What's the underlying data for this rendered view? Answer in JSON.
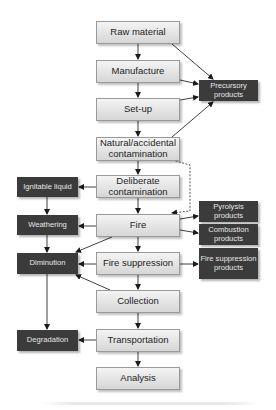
{
  "diagram": {
    "nodes": {
      "raw_material": "Raw material",
      "manufacture": "Manufacture",
      "set_up": "Set-up",
      "natural_contamination": "Natural/accidental contamination",
      "deliberate_contamination": "Deliberate contamination",
      "fire": "Fire",
      "fire_suppression": "Fire suppression",
      "collection": "Collection",
      "transportation": "Transportation",
      "analysis": "Analysis",
      "precursory_products": "Precursory products",
      "ignitable_liquid": "Ignitable liquid",
      "weathering": "Weathering",
      "diminution": "Diminution",
      "degradation": "Degradation",
      "pyrolysis_products": "Pyrolysis products",
      "combustion_products": "Combustion products",
      "fire_suppression_products": "Fire suppression products"
    },
    "edges": [
      {
        "from": "raw_material",
        "to": "manufacture",
        "style": "solid"
      },
      {
        "from": "manufacture",
        "to": "set_up",
        "style": "solid"
      },
      {
        "from": "set_up",
        "to": "natural_contamination",
        "style": "solid"
      },
      {
        "from": "natural_contamination",
        "to": "deliberate_contamination",
        "style": "solid"
      },
      {
        "from": "deliberate_contamination",
        "to": "fire",
        "style": "solid"
      },
      {
        "from": "fire",
        "to": "fire_suppression",
        "style": "solid"
      },
      {
        "from": "fire_suppression",
        "to": "collection",
        "style": "solid"
      },
      {
        "from": "collection",
        "to": "transportation",
        "style": "solid"
      },
      {
        "from": "transportation",
        "to": "analysis",
        "style": "solid"
      },
      {
        "from": "raw_material",
        "to": "precursory_products",
        "style": "solid"
      },
      {
        "from": "manufacture",
        "to": "precursory_products",
        "style": "solid"
      },
      {
        "from": "set_up",
        "to": "precursory_products",
        "style": "solid"
      },
      {
        "from": "natural_contamination",
        "to": "precursory_products",
        "style": "solid"
      },
      {
        "from": "natural_contamination",
        "to": "fire",
        "style": "dashed"
      },
      {
        "from": "deliberate_contamination",
        "to": "ignitable_liquid",
        "style": "solid"
      },
      {
        "from": "ignitable_liquid",
        "to": "weathering",
        "style": "solid"
      },
      {
        "from": "fire",
        "to": "weathering",
        "style": "solid"
      },
      {
        "from": "weathering",
        "to": "diminution",
        "style": "solid"
      },
      {
        "from": "fire",
        "to": "diminution",
        "style": "solid"
      },
      {
        "from": "fire_suppression",
        "to": "diminution",
        "style": "solid"
      },
      {
        "from": "collection",
        "to": "diminution",
        "style": "solid"
      },
      {
        "from": "diminution",
        "to": "degradation",
        "style": "solid"
      },
      {
        "from": "transportation",
        "to": "degradation",
        "style": "solid"
      },
      {
        "from": "fire",
        "to": "pyrolysis_products",
        "style": "solid"
      },
      {
        "from": "fire",
        "to": "combustion_products",
        "style": "solid"
      },
      {
        "from": "fire_suppression",
        "to": "fire_suppression_products",
        "style": "solid"
      }
    ]
  }
}
